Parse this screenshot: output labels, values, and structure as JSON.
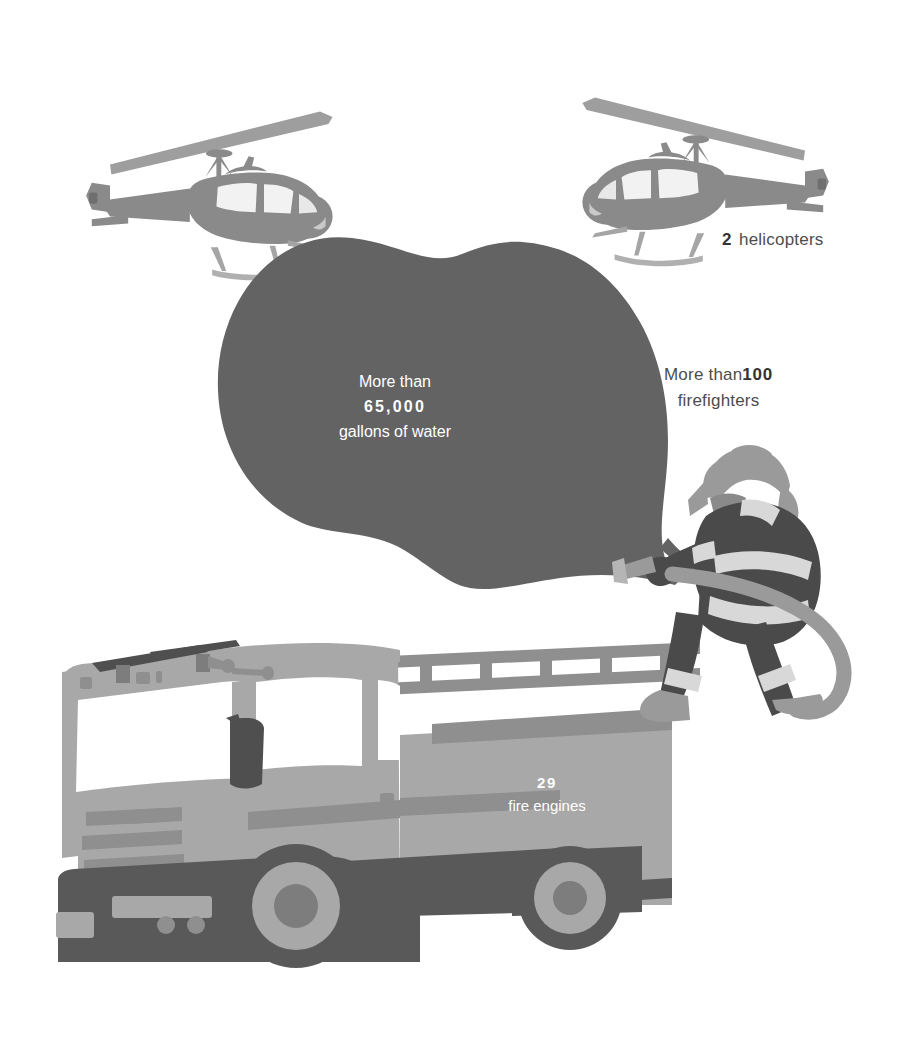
{
  "infographic": {
    "background_color": "#ffffff",
    "palette": {
      "water_blob": "#636363",
      "helicopter_body": "#8a8a8a",
      "helicopter_rotor": "#9e9e9e",
      "helicopter_window": "#c9c9c9",
      "engine_body": "#a8a8a8",
      "engine_dark": "#595959",
      "engine_mid": "#8f8f8f",
      "firefighter_coat": "#4a4a4a",
      "firefighter_stripe": "#d8d8d8",
      "firefighter_gear": "#9a9a9a",
      "hose": "#9a9a9a",
      "label_text": "#4d4d4d",
      "label_number": "#333333",
      "art_text": "#ffffff"
    },
    "items": [
      {
        "id": "helicopters",
        "icon": "helicopter-icon",
        "count": "2",
        "unit": "helicopters",
        "prefix": "",
        "placement": "outside-right"
      },
      {
        "id": "firefighters",
        "icon": "firefighter-icon",
        "count": "100",
        "unit": "firefighters",
        "prefix": "More than",
        "placement": "outside-right"
      },
      {
        "id": "water",
        "icon": "water-spray-icon",
        "count": "65,000",
        "unit": "gallons of water",
        "prefix": "More than",
        "placement": "inside-art"
      },
      {
        "id": "fire-engines",
        "icon": "fire-engine-icon",
        "count": "29",
        "unit": "fire engines",
        "prefix": "",
        "placement": "inside-art"
      }
    ],
    "labels": {
      "helicopters": {
        "count": "2",
        "unit": "helicopters"
      },
      "firefighters": {
        "prefix": "More than",
        "count": "100",
        "unit": "firefighters"
      },
      "water": {
        "prefix": "More than",
        "count": "65,000",
        "unit": "gallons of water"
      },
      "fire_engines": {
        "count": "29",
        "unit": "fire engines"
      }
    }
  }
}
